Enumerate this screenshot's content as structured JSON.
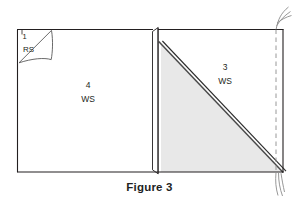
{
  "figure": {
    "caption": "Figure 3",
    "panels": [
      {
        "id": "corner-flap",
        "number": "1",
        "side": "RS",
        "description": "folded-back corner showing right side of fabric"
      },
      {
        "id": "left-panel",
        "number": "4",
        "side": "WS",
        "description": "large left rectangle showing wrong side of fabric"
      },
      {
        "id": "right-panel",
        "number": "3",
        "side": "WS",
        "description": "right rectangle with shaded folded triangle, wrong side of fabric"
      }
    ],
    "marks": {
      "stitch_line_style": "dashed",
      "thread_tails": 2,
      "fold_edge": "vertical-center-flap",
      "diagonal_fold": "top-left-to-bottom-right"
    },
    "colors": {
      "outline": "#231f20",
      "shade_fill": "#e8e8e8",
      "paper": "#ffffff",
      "thread": "#8c8c8c",
      "dash": "#8c8c8c"
    }
  }
}
